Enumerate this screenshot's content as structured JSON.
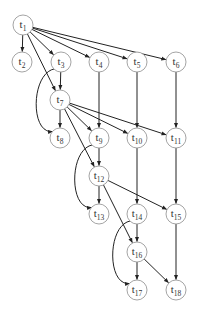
{
  "diagram": {
    "type": "directed-acyclic-graph",
    "colors": {
      "node_stroke": "#9a9a9a",
      "edge": "#222222",
      "text": "#333333",
      "background": "#ffffff"
    },
    "node_radius": 10,
    "nodes": [
      {
        "id": "t1",
        "label": "t",
        "sub": "1",
        "x": 23,
        "y": 25
      },
      {
        "id": "t2",
        "label": "t",
        "sub": "2",
        "x": 22,
        "y": 62
      },
      {
        "id": "t3",
        "label": "t",
        "sub": "3",
        "x": 61,
        "y": 62
      },
      {
        "id": "t4",
        "label": "t",
        "sub": "4",
        "x": 99,
        "y": 62
      },
      {
        "id": "t5",
        "label": "t",
        "sub": "5",
        "x": 137,
        "y": 62
      },
      {
        "id": "t6",
        "label": "t",
        "sub": "6",
        "x": 176,
        "y": 62
      },
      {
        "id": "t7",
        "label": "t",
        "sub": "7",
        "x": 60,
        "y": 100
      },
      {
        "id": "t8",
        "label": "t",
        "sub": "8",
        "x": 60,
        "y": 138
      },
      {
        "id": "t9",
        "label": "t",
        "sub": "9",
        "x": 99,
        "y": 138
      },
      {
        "id": "t10",
        "label": "t",
        "sub": "10",
        "x": 137,
        "y": 138
      },
      {
        "id": "t11",
        "label": "t",
        "sub": "11",
        "x": 176,
        "y": 138
      },
      {
        "id": "t12",
        "label": "t",
        "sub": "12",
        "x": 99,
        "y": 176
      },
      {
        "id": "t13",
        "label": "t",
        "sub": "13",
        "x": 99,
        "y": 214
      },
      {
        "id": "t14",
        "label": "t",
        "sub": "14",
        "x": 137,
        "y": 214
      },
      {
        "id": "t15",
        "label": "t",
        "sub": "15",
        "x": 176,
        "y": 214
      },
      {
        "id": "t16",
        "label": "t",
        "sub": "16",
        "x": 137,
        "y": 252
      },
      {
        "id": "t17",
        "label": "t",
        "sub": "17",
        "x": 137,
        "y": 290
      },
      {
        "id": "t18",
        "label": "t",
        "sub": "18",
        "x": 176,
        "y": 290
      }
    ],
    "edges": [
      {
        "from": "t1",
        "to": "t2"
      },
      {
        "from": "t1",
        "to": "t3"
      },
      {
        "from": "t1",
        "to": "t4"
      },
      {
        "from": "t1",
        "to": "t5"
      },
      {
        "from": "t1",
        "to": "t6"
      },
      {
        "from": "t1",
        "to": "t7"
      },
      {
        "from": "t3",
        "to": "t7"
      },
      {
        "from": "t3",
        "to": "t8",
        "curved": true
      },
      {
        "from": "t4",
        "to": "t9"
      },
      {
        "from": "t5",
        "to": "t10"
      },
      {
        "from": "t6",
        "to": "t11"
      },
      {
        "from": "t7",
        "to": "t8"
      },
      {
        "from": "t7",
        "to": "t9"
      },
      {
        "from": "t7",
        "to": "t10"
      },
      {
        "from": "t7",
        "to": "t11"
      },
      {
        "from": "t7",
        "to": "t12"
      },
      {
        "from": "t9",
        "to": "t12"
      },
      {
        "from": "t9",
        "to": "t13",
        "curved": true
      },
      {
        "from": "t10",
        "to": "t14"
      },
      {
        "from": "t11",
        "to": "t15"
      },
      {
        "from": "t12",
        "to": "t13"
      },
      {
        "from": "t12",
        "to": "t15"
      },
      {
        "from": "t12",
        "to": "t16"
      },
      {
        "from": "t14",
        "to": "t16"
      },
      {
        "from": "t14",
        "to": "t17",
        "curved": true
      },
      {
        "from": "t15",
        "to": "t18"
      },
      {
        "from": "t16",
        "to": "t17"
      },
      {
        "from": "t16",
        "to": "t18"
      }
    ]
  }
}
